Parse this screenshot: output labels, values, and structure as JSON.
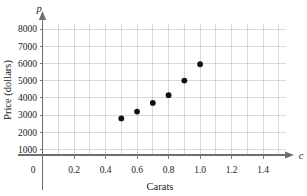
{
  "chart_data": {
    "type": "scatter",
    "title": "",
    "xlabel": "Carats",
    "ylabel": "Price (dollars)",
    "x_variable": "c",
    "y_variable": "p",
    "xlim": [
      0,
      1.55
    ],
    "ylim": [
      0,
      8700
    ],
    "grid": true,
    "grid_x_step": 0.1,
    "grid_y_step": 1000,
    "legend": "none",
    "x_ticks": [
      "0",
      "0.2",
      "0.4",
      "0.6",
      "0.8",
      "1.0",
      "1.2",
      "1.4"
    ],
    "x_tick_values": [
      0,
      0.2,
      0.4,
      0.6,
      0.8,
      1.0,
      1.2,
      1.4
    ],
    "y_ticks": [
      "0",
      "1000",
      "2000",
      "3000",
      "4000",
      "5000",
      "6000",
      "7000",
      "8000"
    ],
    "y_tick_values": [
      0,
      1000,
      2000,
      3000,
      4000,
      5000,
      6000,
      7000,
      8000
    ],
    "x": [
      0.5,
      0.6,
      0.7,
      0.8,
      0.9,
      1.0
    ],
    "values": [
      2800,
      3200,
      3700,
      4150,
      5000,
      5950
    ],
    "points": [
      {
        "c": 0.5,
        "p": 2800
      },
      {
        "c": 0.6,
        "p": 3200
      },
      {
        "c": 0.7,
        "p": 3700
      },
      {
        "c": 0.8,
        "p": 4150
      },
      {
        "c": 0.9,
        "p": 5000
      },
      {
        "c": 1.0,
        "p": 5950
      }
    ],
    "marker": "filled-circle",
    "marker_color": "#111111",
    "grid_color": "#c9c9cf",
    "axis_color": "#6e6e76"
  },
  "axes": {
    "y_axis_variable_label": "p",
    "x_axis_variable_label": "c",
    "y_axis_title": "Price (dollars)",
    "x_axis_title": "Carats"
  }
}
